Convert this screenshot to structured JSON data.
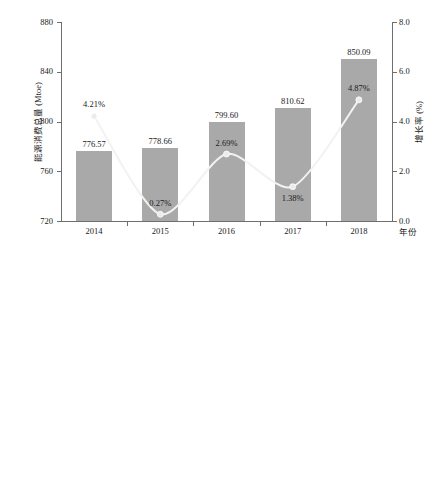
{
  "chart_data": [
    {
      "id": "energy-consumption",
      "type": "bar",
      "title": "",
      "xlabel": "年份",
      "ylabel": "能源消费总量 (Mtoe)",
      "y2label": "增长率 (%)",
      "categories": [
        "2014",
        "2015",
        "2016",
        "2017",
        "2018"
      ],
      "ylim": [
        720,
        880
      ],
      "yticks": [
        "720",
        "760",
        "800",
        "840",
        "880"
      ],
      "ytick_values": [
        720,
        760,
        800,
        840,
        880
      ],
      "y2lim": [
        0.0,
        8.0
      ],
      "y2ticks": [
        "0.0",
        "2.0",
        "4.0",
        "6.0",
        "8.0"
      ],
      "y2tick_values": [
        0.0,
        2.0,
        4.0,
        6.0,
        8.0
      ],
      "grid": false,
      "legend": "none",
      "series": [
        {
          "name": "能源消费总量",
          "kind": "bar",
          "axis": "left",
          "values": [
            776.57,
            778.66,
            799.6,
            810.62,
            850.09
          ],
          "labels": [
            "776.57",
            "778.66",
            "799.60",
            "810.62",
            "850.09"
          ],
          "color": "#a9a9a9"
        },
        {
          "name": "增长率",
          "kind": "line",
          "axis": "right",
          "values": [
            4.21,
            0.27,
            2.69,
            1.38,
            4.87
          ],
          "labels": [
            "4.21%",
            "0.27%",
            "2.69%",
            "1.38%",
            "4.87%"
          ],
          "color": "#f2f2f2",
          "marker_color": "#ebebeb"
        }
      ]
    },
    {
      "id": "energy-intensity",
      "type": "bar",
      "title": "",
      "xlabel": "年份",
      "ylabel": "能源强度 (美元, 2015年价)",
      "y2label": "增长率 (%)",
      "categories": [
        "2014",
        "2015",
        "2016",
        "2017",
        "2018"
      ],
      "ylim": [
        0.13,
        0.14
      ],
      "yticks": [
        "0.130",
        "0.132",
        "0.134",
        "0.136",
        "0.138",
        "0.140"
      ],
      "ytick_values": [
        0.13,
        0.132,
        0.134,
        0.136,
        0.138,
        0.14
      ],
      "y2lim": [
        -4.0,
        6.0
      ],
      "y2ticks": [
        "-4.0",
        "-2.0",
        "0.0",
        "2.0",
        "4.0",
        "6.0"
      ],
      "y2tick_values": [
        -4.0,
        -2.0,
        0.0,
        2.0,
        4.0,
        6.0
      ],
      "grid": false,
      "legend": "none",
      "series": [
        {
          "name": "能源强度",
          "kind": "bar",
          "axis": "left",
          "values": [
            0.1389,
            0.1348,
            0.1356,
            0.1331,
            0.1352
          ],
          "labels": [
            "0.1389",
            "0.1348",
            "0.1356",
            "0.1331",
            "0.1352"
          ],
          "color": "#a9a9a9"
        },
        {
          "name": "增长率",
          "kind": "line",
          "axis": "right",
          "values": [
            1.2,
            -3.0,
            0.63,
            -1.85,
            1.53
          ],
          "labels": [
            "1.20%",
            "-3.00%",
            "0.63%",
            "-1.85%",
            "1.53%"
          ],
          "color": "#f2f2f2",
          "marker_color": "#ebebeb"
        }
      ]
    }
  ],
  "colors": {
    "bar": "#a9a9a9",
    "line": "#f2f2f2",
    "marker": "#ebebeb",
    "axis": "#6f6f6f",
    "text": "#1a1a1a",
    "background": "#ffffff"
  }
}
